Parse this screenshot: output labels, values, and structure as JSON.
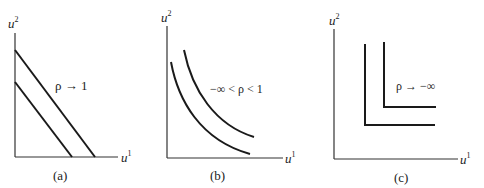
{
  "panels": [
    {
      "id": "a",
      "caption": "(a)",
      "x_axis_label": "u",
      "x_axis_sup": "1",
      "y_axis_label": "u",
      "y_axis_sup": "2",
      "annotation": "ρ → 1",
      "curve_type": "linear indifference curves (perfect substitutes)"
    },
    {
      "id": "b",
      "caption": "(b)",
      "x_axis_label": "u",
      "x_axis_sup": "1",
      "y_axis_label": "u",
      "y_axis_sup": "2",
      "annotation": "−∞ < ρ < 1",
      "curve_type": "convex indifference curves"
    },
    {
      "id": "c",
      "caption": "(c)",
      "x_axis_label": "u",
      "x_axis_sup": "1",
      "y_axis_label": "u",
      "y_axis_sup": "2",
      "annotation": "ρ → −∞",
      "curve_type": "L-shaped indifference curves (perfect complements)"
    }
  ],
  "colors": {
    "line": "#1a1a1a",
    "axis": "#333333",
    "text": "#222222"
  }
}
